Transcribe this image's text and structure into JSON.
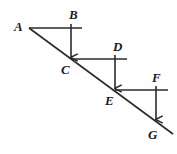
{
  "figure": {
    "type": "geometry-diagram",
    "width": 177,
    "height": 154,
    "background_color": "#fefefe",
    "stroke_color": "#2b2b2b",
    "label_color": "#1b1b1b",
    "stroke_width": 1.6,
    "labels": [
      {
        "id": "A",
        "text": "A",
        "x": 14,
        "y": 20
      },
      {
        "id": "B",
        "text": "B",
        "x": 69,
        "y": 8
      },
      {
        "id": "C",
        "text": "C",
        "x": 61,
        "y": 63
      },
      {
        "id": "D",
        "text": "D",
        "x": 113,
        "y": 40
      },
      {
        "id": "E",
        "text": "E",
        "x": 105,
        "y": 94
      },
      {
        "id": "F",
        "text": "F",
        "x": 152,
        "y": 71
      },
      {
        "id": "G",
        "text": "G",
        "x": 148,
        "y": 128
      }
    ],
    "points": [
      {
        "id": "A",
        "x": 29,
        "y": 28
      },
      {
        "id": "B",
        "x": 71,
        "y": 28
      },
      {
        "id": "C",
        "x": 71,
        "y": 59
      },
      {
        "id": "D",
        "x": 115,
        "y": 59
      },
      {
        "id": "E",
        "x": 115,
        "y": 90
      },
      {
        "id": "F",
        "x": 156,
        "y": 90
      },
      {
        "id": "G",
        "x": 156,
        "y": 121
      }
    ],
    "transversal": {
      "from": {
        "x": 29,
        "y": 28
      },
      "to": {
        "x": 173,
        "y": 134
      }
    },
    "horizontal_segments": [
      {
        "name": "segment-A-B",
        "x1": 29,
        "y1": 28,
        "x2": 82,
        "y2": 28
      },
      {
        "name": "segment-C-D",
        "x1": 71,
        "y1": 59,
        "x2": 127,
        "y2": 59
      },
      {
        "name": "segment-E-F",
        "x1": 115,
        "y1": 90,
        "x2": 168,
        "y2": 90
      }
    ],
    "arrow_segments": [
      {
        "name": "arrow-B-C",
        "x1": 71,
        "y1": 24,
        "x2": 71,
        "y2": 59
      },
      {
        "name": "arrow-D-E",
        "x1": 115,
        "y1": 55,
        "x2": 115,
        "y2": 90
      },
      {
        "name": "arrow-F-G",
        "x1": 156,
        "y1": 86,
        "x2": 156,
        "y2": 121
      }
    ],
    "triangles": [
      {
        "name": "triangle-ABC",
        "vertices": [
          "A",
          "B",
          "C"
        ]
      },
      {
        "name": "triangle-CDE",
        "vertices": [
          "C",
          "D",
          "E"
        ]
      },
      {
        "name": "triangle-EFG",
        "vertices": [
          "E",
          "F",
          "G"
        ]
      }
    ]
  }
}
